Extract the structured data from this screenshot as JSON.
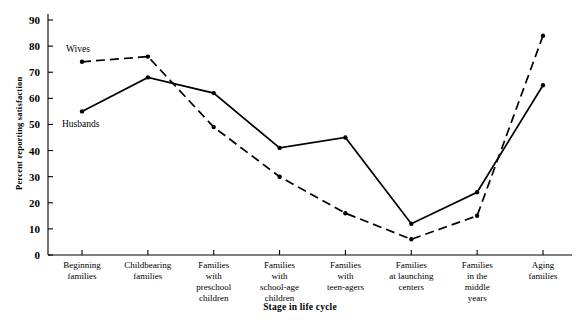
{
  "chart_data": {
    "type": "line",
    "title": "",
    "xlabel": "Stage in life cycle",
    "ylabel": "Percent reporting satisfaction",
    "ylim": [
      0,
      90
    ],
    "ytick_step": 10,
    "yticks": [
      0,
      10,
      20,
      30,
      40,
      50,
      60,
      70,
      80,
      90
    ],
    "ytick_labels": [
      "0",
      "10",
      "20",
      "30",
      "40",
      "50",
      "60",
      "70",
      "80",
      "90"
    ],
    "grid": false,
    "legend_position": "inline-annotation",
    "categories": [
      "Beginning families",
      "Childbearing families",
      "Families with preschool children",
      "Families with school-age children",
      "Families with teen-agers",
      "Families at launching centers",
      "Families in the middle years",
      "Aging families"
    ],
    "category_label_lines": [
      [
        "Beginning",
        "families"
      ],
      [
        "Childbearing",
        "families"
      ],
      [
        "Families",
        "with",
        "preschool",
        "children"
      ],
      [
        "Families",
        "with",
        "school-age",
        "children"
      ],
      [
        "Families",
        "with",
        "teen-agers"
      ],
      [
        "Families",
        "at launching",
        "centers"
      ],
      [
        "Families",
        "in the",
        "middle",
        "years"
      ],
      [
        "Aging",
        "families"
      ]
    ],
    "series": [
      {
        "name": "Wives",
        "style": "dashed",
        "color": "#000000",
        "values": [
          74,
          76,
          49,
          30,
          16,
          6,
          15,
          84
        ]
      },
      {
        "name": "Husbands",
        "style": "solid",
        "color": "#000000",
        "values": [
          55,
          68,
          62,
          41,
          45,
          12,
          24,
          65
        ]
      }
    ],
    "annotations": [
      {
        "text": "Wives",
        "series": "Wives"
      },
      {
        "text": "Husbands",
        "series": "Husbands"
      }
    ]
  }
}
